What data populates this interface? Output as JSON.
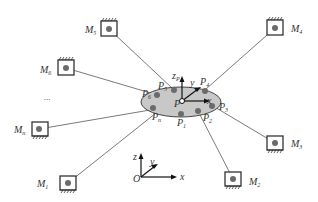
{
  "diagram": {
    "type": "cable-driven parallel mechanism schematic",
    "motors": [
      {
        "id": "M1",
        "label": "M",
        "sub": "1",
        "x": 68,
        "y": 183,
        "hatch": "bottom"
      },
      {
        "id": "M2",
        "label": "M",
        "sub": "2",
        "x": 233,
        "y": 179,
        "hatch": "bottom"
      },
      {
        "id": "M3",
        "label": "M",
        "sub": "3",
        "x": 275,
        "y": 143,
        "hatch": "bottom"
      },
      {
        "id": "M4",
        "label": "M",
        "sub": "4",
        "x": 275,
        "y": 28,
        "hatch": "top"
      },
      {
        "id": "M5",
        "label": "M",
        "sub": "5",
        "x": 109,
        "y": 29,
        "hatch": "top"
      },
      {
        "id": "M6",
        "label": "M",
        "sub": "6",
        "x": 66,
        "y": 68,
        "hatch": "top"
      },
      {
        "id": "Mn",
        "label": "M",
        "sub": "n",
        "x": 39,
        "y": 129,
        "hatch": "bottom"
      }
    ],
    "ellipsis": "...",
    "platform": {
      "center_label": "P",
      "anchors": [
        {
          "id": "P1",
          "label": "P",
          "sub": "1"
        },
        {
          "id": "P2",
          "label": "P",
          "sub": "2"
        },
        {
          "id": "P3",
          "label": "P",
          "sub": "3"
        },
        {
          "id": "P4",
          "label": "P",
          "sub": "4"
        },
        {
          "id": "P5",
          "label": "P",
          "sub": "5"
        },
        {
          "id": "P6",
          "label": "P",
          "sub": "6"
        },
        {
          "id": "Pn",
          "label": "P",
          "sub": "n"
        }
      ],
      "local_axes": {
        "z": "z",
        "z_sub": "P",
        "y": "y",
        "y_sub": "P",
        "x": "x",
        "x_sub": "P"
      }
    },
    "world_frame": {
      "origin": "O",
      "x": "x",
      "y": "y",
      "z": "z"
    },
    "colors": {
      "platform_fill": "#c8c8c8",
      "cable": "#7a7a7a",
      "anchor_dot": "#6b6b6b",
      "box_stroke": "#333333"
    }
  }
}
